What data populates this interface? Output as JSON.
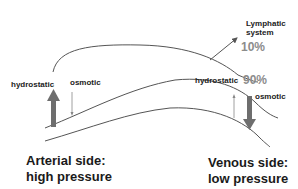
{
  "diagram": {
    "labels": {
      "lymphatic_line1": "Lymphatic",
      "lymphatic_line2": "system",
      "pct_lymph": "10%",
      "pct_venous": "90%",
      "arterial_hydrostatic": "hydrostatic",
      "arterial_osmotic": "osmotic",
      "venous_hydrostatic": "hydrostatic",
      "venous_osmotic": "osmotic",
      "arterial_line1": "Arterial side:",
      "arterial_line2": "high pressure",
      "venous_line1": "Venous side:",
      "venous_line2": "low pressure"
    },
    "colors": {
      "line": "#555555",
      "arrow": "#6e6e6e",
      "percent": "#8c8c8c"
    }
  }
}
